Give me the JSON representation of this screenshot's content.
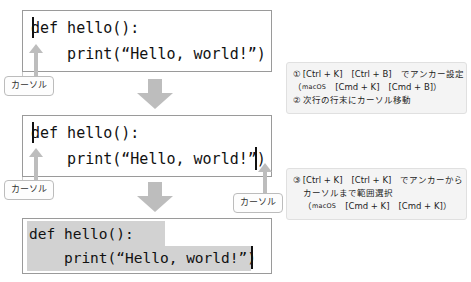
{
  "figure": {
    "accent_gray": "#bdbdbd",
    "selection_color": "#d2d2d2",
    "note_bg": "#f4f4f4"
  },
  "code_blocks": [
    {
      "id": "block-1",
      "line1": "def hello():",
      "line2": "    print(“Hello, world!”)",
      "caret": "line-start",
      "selection": false
    },
    {
      "id": "block-2",
      "line1": "def hello():",
      "line2": "    print(“Hello, world!”)",
      "caret": "line2-end",
      "selection": false
    },
    {
      "id": "block-3",
      "line1": "def hello():",
      "line2": "    print(“Hello, world!”)",
      "caret": "line2-end",
      "selection": true
    }
  ],
  "callouts": [
    {
      "id": "cursor-label-1",
      "label": "カーソル"
    },
    {
      "id": "cursor-label-2",
      "label": "カーソル"
    },
    {
      "id": "cursor-label-3",
      "label": "カーソル"
    }
  ],
  "arrows": [
    {
      "id": "flow-arrow-1",
      "direction": "down"
    },
    {
      "id": "flow-arrow-2",
      "direction": "down"
    }
  ],
  "notes": {
    "note1": {
      "line1_marker": "①",
      "line1_text": "[Ctrl + K]　[Ctrl + B]　でアンカー設定",
      "line2_prefix": "（",
      "line2_os": "macOS",
      "line2_text": "　[Cmd + K]　[Cmd + B]）",
      "line3_marker": "②",
      "line3_text": "次行の行末にカーソル移動"
    },
    "note2": {
      "line1_marker": "③",
      "line1_text": "[Ctrl + K]　[Ctrl + K]　でアンカーから",
      "line2_text": "カーソルまで範囲選択",
      "line3_prefix": "（",
      "line3_os": "macOS",
      "line3_text": "　[Cmd + K]　[Cmd + K]）"
    }
  }
}
